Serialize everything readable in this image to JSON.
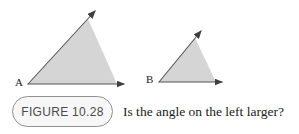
{
  "figure": {
    "labels": {
      "left_vertex": "A",
      "right_vertex": "B"
    },
    "colors": {
      "triangle_fill": "#d5d5d5",
      "ray_stroke": "#555555",
      "arrowhead_fill": "#3f3f3f",
      "badge_border": "#919191",
      "badge_fill": "#f7f7f7",
      "badge_text": "#4a4a4a",
      "caption_text": "#1b1b1b",
      "background": "#ffffff"
    },
    "geometry": {
      "left_angle": {
        "fill_points": "28,84 88,19 117,84",
        "ray_up": "M28,84 L95,11",
        "ray_right": "M28,84 L124,84"
      },
      "right_angle": {
        "fill_points": "159,82 195,38 216,82",
        "ray_up": "M159,82 L201,31",
        "ray_right": "M159,82 L222,82"
      }
    }
  },
  "caption": {
    "figure_label": "FIGURE 10.28",
    "question": "Is the angle on the left larger?"
  }
}
